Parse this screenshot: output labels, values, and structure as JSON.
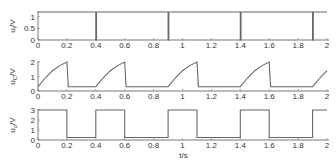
{
  "chart_data": [
    {
      "type": "line",
      "title": "",
      "xlabel": "",
      "ylabel": "u_i/V",
      "ylabel_main": "u",
      "ylabel_sub": "i",
      "ylabel_unit": "/V",
      "xlim": [
        0,
        2
      ],
      "ylim": [
        0,
        1.2
      ],
      "xticks": [
        "0",
        "0.2",
        "0.4",
        "0.6",
        "0.8",
        "1",
        "1.2",
        "1.4",
        "1.6",
        "1.8",
        "2"
      ],
      "yticks": [
        "0",
        "0.5",
        "1"
      ],
      "grid": false,
      "series": [
        {
          "name": "u_i",
          "x": [
            0,
            0.4,
            0.4,
            0.405,
            0.405,
            0.9,
            0.9,
            0.905,
            0.905,
            1.4,
            1.4,
            1.405,
            1.405,
            1.9,
            1.9,
            1.905,
            1.905,
            2
          ],
          "y": [
            1.2,
            1.2,
            0,
            0,
            1.2,
            1.2,
            0,
            0,
            1.2,
            1.2,
            0,
            0,
            1.2,
            1.2,
            0,
            0,
            1.2,
            1.2
          ]
        }
      ]
    },
    {
      "type": "line",
      "title": "",
      "xlabel": "",
      "ylabel": "u_C/V",
      "ylabel_main": "u",
      "ylabel_sub": "C",
      "ylabel_unit": "/V",
      "xlim": [
        0,
        2
      ],
      "ylim": [
        0,
        2
      ],
      "xticks": [
        "0",
        "0.2",
        "0.4",
        "0.6",
        "0.8",
        "1",
        "1.2",
        "1.4",
        "1.6",
        "1.8",
        "2"
      ],
      "yticks": [
        "0",
        "1",
        "2"
      ],
      "grid": false,
      "series": [
        {
          "name": "u_C",
          "description": "charges exponentially from ~0.3 V to ~2 V over 0.2 s, drops back to ~0.3 V, flat until next cycle",
          "x": [
            0,
            0.05,
            0.1,
            0.15,
            0.2,
            0.21,
            0.4,
            0.45,
            0.5,
            0.55,
            0.6,
            0.61,
            0.9,
            0.95,
            1.0,
            1.05,
            1.1,
            1.11,
            1.4,
            1.45,
            1.5,
            1.55,
            1.6,
            1.61,
            1.9,
            1.95,
            2.0
          ],
          "y": [
            0.3,
            0.9,
            1.4,
            1.75,
            2.0,
            0.3,
            0.3,
            0.9,
            1.4,
            1.75,
            2.0,
            0.3,
            0.3,
            0.9,
            1.4,
            1.75,
            2.0,
            0.3,
            0.3,
            0.9,
            1.4,
            1.75,
            2.0,
            0.3,
            0.3,
            0.9,
            1.4
          ]
        }
      ]
    },
    {
      "type": "line",
      "title": "",
      "xlabel": "t/s",
      "ylabel": "u_o/V",
      "ylabel_main": "u",
      "ylabel_sub": "o",
      "ylabel_unit": "/V",
      "xlim": [
        0,
        2
      ],
      "ylim": [
        0,
        3
      ],
      "xticks": [
        "0",
        "0.2",
        "0.4",
        "0.6",
        "0.8",
        "1",
        "1.2",
        "1.4",
        "1.6",
        "1.8",
        "2"
      ],
      "yticks": [
        "0",
        "1",
        "2",
        "3"
      ],
      "grid": false,
      "series": [
        {
          "name": "u_o",
          "x": [
            0,
            0.2,
            0.2,
            0.4,
            0.4,
            0.6,
            0.6,
            0.9,
            0.9,
            1.1,
            1.1,
            1.4,
            1.4,
            1.6,
            1.6,
            1.9,
            1.9,
            2.0
          ],
          "y": [
            3,
            3,
            0.25,
            0.25,
            3,
            3,
            0.25,
            0.25,
            3,
            3,
            0.25,
            0.25,
            3,
            3,
            0.25,
            0.25,
            3,
            3
          ]
        }
      ]
    }
  ]
}
